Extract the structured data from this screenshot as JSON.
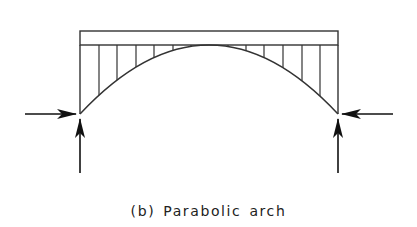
{
  "figure": {
    "caption": "(b) Parabolic arch",
    "type": "structural-diagram"
  },
  "colors": {
    "background": "#ffffff",
    "line": "#333333",
    "arrow": "#111111",
    "caption": "#222222"
  },
  "geometry": {
    "deck": {
      "x1": 80,
      "x2": 338,
      "top": 31,
      "bottom": 45
    },
    "arch": {
      "left": [
        80,
        114
      ],
      "right": [
        338,
        114
      ],
      "apex_y": 45
    },
    "hangers_x": [
      99,
      117,
      136,
      154,
      173,
      191,
      228,
      246,
      264,
      283,
      302,
      320
    ],
    "supports": {
      "left": {
        "horizontal_arrow": {
          "from": [
            25,
            114
          ],
          "to": [
            76,
            114
          ],
          "direction": "right"
        },
        "vertical_arrow": {
          "from": [
            80,
            173
          ],
          "to": [
            80,
            119
          ],
          "direction": "up"
        }
      },
      "right": {
        "horizontal_arrow": {
          "from": [
            393,
            114
          ],
          "to": [
            342,
            114
          ],
          "direction": "left"
        },
        "vertical_arrow": {
          "from": [
            338,
            173
          ],
          "to": [
            338,
            119
          ],
          "direction": "up"
        }
      }
    }
  },
  "labels": {
    "left_horizontal_thrust": "horizontal reaction (left support)",
    "right_horizontal_thrust": "horizontal reaction (right support)",
    "left_vertical_reaction": "vertical reaction (left support)",
    "right_vertical_reaction": "vertical reaction (right support)"
  }
}
